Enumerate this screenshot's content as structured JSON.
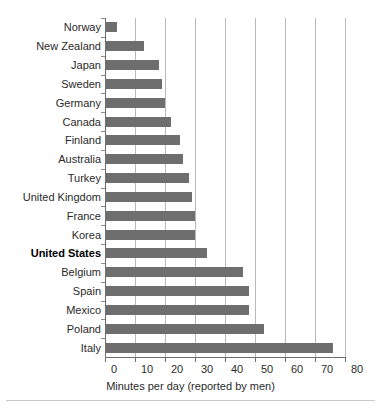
{
  "chart_data": {
    "type": "bar",
    "orientation": "horizontal",
    "title": "",
    "subtitle": "",
    "xlabel": "Minutes per day (reported by men)",
    "ylabel": "",
    "xlim": [
      0,
      80
    ],
    "xticks": [
      0,
      10,
      20,
      30,
      40,
      50,
      60,
      70,
      80
    ],
    "xtick_labels": [
      "0",
      "10",
      "20",
      "30",
      "40",
      "50",
      "60",
      "70",
      "80"
    ],
    "grid": "vertical",
    "legend": "none",
    "bar_color": "#6e6e6e",
    "highlight_category": "United States",
    "categories": [
      "Norway",
      "New Zealand",
      "Japan",
      "Sweden",
      "Germany",
      "Canada",
      "Finland",
      "Australia",
      "Turkey",
      "United Kingdom",
      "France",
      "Korea",
      "United States",
      "Belgium",
      "Spain",
      "Mexico",
      "Poland",
      "Italy"
    ],
    "values": [
      4,
      13,
      18,
      19,
      20,
      22,
      25,
      26,
      28,
      29,
      30,
      30,
      34,
      46,
      48,
      48,
      53,
      76
    ],
    "points": [
      {
        "category": "Norway",
        "value": 4,
        "highlight": false
      },
      {
        "category": "New Zealand",
        "value": 13,
        "highlight": false
      },
      {
        "category": "Japan",
        "value": 18,
        "highlight": false
      },
      {
        "category": "Sweden",
        "value": 19,
        "highlight": false
      },
      {
        "category": "Germany",
        "value": 20,
        "highlight": false
      },
      {
        "category": "Canada",
        "value": 22,
        "highlight": false
      },
      {
        "category": "Finland",
        "value": 25,
        "highlight": false
      },
      {
        "category": "Australia",
        "value": 26,
        "highlight": false
      },
      {
        "category": "Turkey",
        "value": 28,
        "highlight": false
      },
      {
        "category": "United Kingdom",
        "value": 29,
        "highlight": false
      },
      {
        "category": "France",
        "value": 30,
        "highlight": false
      },
      {
        "category": "Korea",
        "value": 30,
        "highlight": false
      },
      {
        "category": "United States",
        "value": 34,
        "highlight": true
      },
      {
        "category": "Belgium",
        "value": 46,
        "highlight": false
      },
      {
        "category": "Spain",
        "value": 48,
        "highlight": false
      },
      {
        "category": "Mexico",
        "value": 48,
        "highlight": false
      },
      {
        "category": "Poland",
        "value": 53,
        "highlight": false
      },
      {
        "category": "Italy",
        "value": 76,
        "highlight": false
      }
    ]
  }
}
